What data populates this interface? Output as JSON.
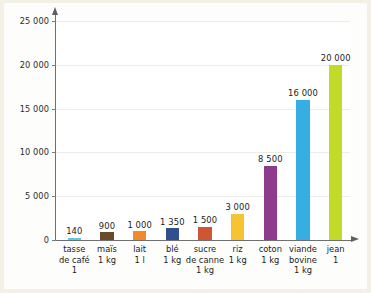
{
  "chart_data": {
    "type": "bar",
    "title": "",
    "xlabel": "",
    "ylabel": "",
    "ylim": [
      0,
      25000
    ],
    "grid": true,
    "legend": "none",
    "y_ticks": [
      "0",
      "5 000",
      "10 000",
      "15 000",
      "20 000",
      "25 000"
    ],
    "y_tick_values": [
      0,
      5000,
      10000,
      15000,
      20000,
      25000
    ],
    "categories": [
      "tasse de café 1",
      "maïs 1 kg",
      "lait 1 l",
      "blé 1 kg",
      "sucre de canne 1 kg",
      "riz 1 kg",
      "coton 1 kg",
      "viande bovine 1 kg",
      "jean 1"
    ],
    "category_lines": [
      [
        "tasse",
        "de café",
        "1"
      ],
      [
        "maïs",
        "1 kg"
      ],
      [
        "lait",
        "1 l"
      ],
      [
        "blé",
        "1 kg"
      ],
      [
        "sucre",
        "de canne",
        "1 kg"
      ],
      [
        "riz",
        "1 kg"
      ],
      [
        "coton",
        "1 kg"
      ],
      [
        "viande",
        "bovine",
        "1 kg"
      ],
      [
        "jean",
        "1"
      ]
    ],
    "values": [
      140,
      900,
      1000,
      1350,
      1500,
      3000,
      8500,
      16000,
      20000
    ],
    "value_labels": [
      "140",
      "900",
      "1 000",
      "1 350",
      "1 500",
      "3 000",
      "8 500",
      "16 000",
      "20 000"
    ],
    "colors": [
      "#5ec8e8",
      "#6b4a2a",
      "#ef8b2c",
      "#2f4f8f",
      "#cf5533",
      "#f5c430",
      "#8e3b8e",
      "#35aee2",
      "#c2db28"
    ]
  },
  "colors": {
    "page_background": "#f3f0e6",
    "card_background": "#fdfdfb",
    "plot_background": "#ffffff",
    "gridline": "#ececeb",
    "axis": "#6f6f6f",
    "text": "#1c1c1c"
  }
}
